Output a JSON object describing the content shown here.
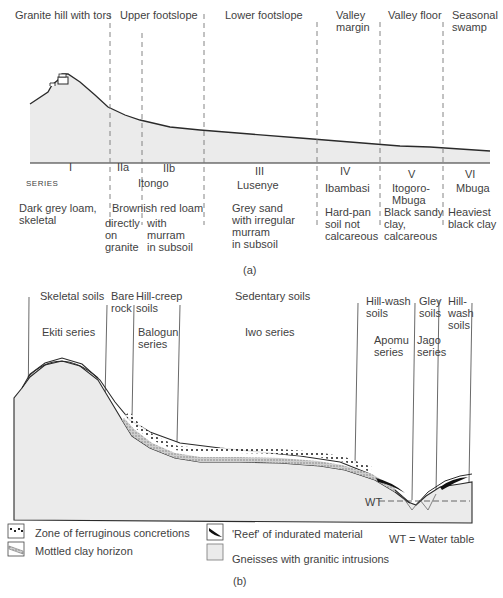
{
  "panel_a": {
    "caption": "(a)",
    "zone_headers": [
      {
        "label": "Granite hill with tors",
        "x": 5,
        "y": 8
      },
      {
        "label": "Upper footslope",
        "x": 121,
        "y": 8
      },
      {
        "label": "Lower footslope",
        "x": 255,
        "y": 8
      },
      {
        "label": "Valley\nmargin",
        "x": 336,
        "y": 8
      },
      {
        "label": "Valley floor",
        "x": 389,
        "y": 8
      },
      {
        "label": "Seasonal\nswamp",
        "x": 452,
        "y": 8
      }
    ],
    "series_label": "SERIES",
    "series": [
      {
        "numeral": "I",
        "name": "",
        "description": "Dark grey loam,\nskeletal"
      },
      {
        "numeral": "IIa",
        "name": "Itongo",
        "description": "Brownish red loam"
      },
      {
        "numeral": "IIb",
        "name": "",
        "description": ""
      },
      {
        "numeral": "III",
        "name": "Lusenye",
        "description": "Grey sand\nwith irregular\nmurram\nin subsoil"
      },
      {
        "numeral": "IV",
        "name": "Ibambasi",
        "description": "Hard-pan\nsoil not\ncalcareous"
      },
      {
        "numeral": "V",
        "name": "Itogoro-\nMbuga",
        "description": "Black sandy\nclay,\ncalcareous"
      },
      {
        "numeral": "VI",
        "name": "Mbuga",
        "description": "Heaviest\nblack clay"
      }
    ],
    "sub_descriptions": {
      "IIa": "directly\non\ngranite",
      "IIb": "with\nmurram\nin subsoil"
    }
  },
  "panel_b": {
    "caption": "(b)",
    "zone_headers": [
      {
        "label": "Skeletal soils",
        "x": 40,
        "y": 289
      },
      {
        "label": "Bare\nrock",
        "x": 111,
        "y": 289
      },
      {
        "label": "Hill-creep\nsoils",
        "x": 136,
        "y": 289
      },
      {
        "label": "Sedentary soils",
        "x": 235,
        "y": 289
      },
      {
        "label": "Hill-wash\nsoils",
        "x": 366,
        "y": 289
      },
      {
        "label": "Gley\nsoils",
        "x": 419,
        "y": 289
      },
      {
        "label": "Hill-\nwash\nsoils",
        "x": 448,
        "y": 289
      }
    ],
    "series_labels": [
      {
        "label": "Ekiti series",
        "x": 42,
        "y": 325
      },
      {
        "label": "Balogun\nseries",
        "x": 138,
        "y": 325
      },
      {
        "label": "Iwo series",
        "x": 245,
        "y": 325
      },
      {
        "label": "Apomu\nseries",
        "x": 374,
        "y": 332
      },
      {
        "label": "Jago\nseries",
        "x": 417,
        "y": 332
      }
    ],
    "water_table_marker": "WT",
    "legend": [
      {
        "symbol": "ferruginous-concretions",
        "label": "Zone of ferruginous concretions"
      },
      {
        "symbol": "mottled-clay",
        "label": "Mottled clay horizon"
      },
      {
        "symbol": "reef",
        "label": "'Reef' of indurated material"
      },
      {
        "symbol": "gneiss",
        "label": "Gneisses with granitic intrusions"
      }
    ],
    "legend_note": "WT = Water table"
  },
  "colors": {
    "ground_fill": "#ebebeb",
    "line": "#2a2a2a",
    "dashed": "#777777",
    "text": "#3f3f3f"
  }
}
